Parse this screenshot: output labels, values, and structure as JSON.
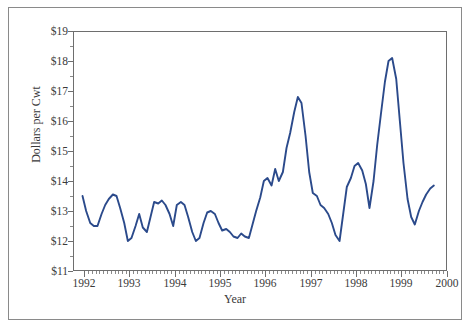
{
  "chart_data": {
    "type": "line",
    "title": "",
    "xlabel": "Year",
    "ylabel": "Dollars per Cwt",
    "xlim": [
      1991.75,
      2000.0
    ],
    "ylim": [
      11,
      19
    ],
    "grid": false,
    "legend": null,
    "line_color": "#2b4a8b",
    "y_tick_labels": [
      "$19",
      "$18",
      "$17",
      "$16",
      "$15",
      "$14",
      "$13",
      "$12",
      "$11"
    ],
    "y_tick_values": [
      19,
      18,
      17,
      16,
      15,
      14,
      13,
      12,
      11
    ],
    "y_minor_step": 0.5,
    "x_tick_labels": [
      "1992",
      "1993",
      "1994",
      "1995",
      "1996",
      "1997",
      "1998",
      "1999",
      "2000"
    ],
    "x_tick_values": [
      1992,
      1993,
      1994,
      1995,
      1996,
      1997,
      1998,
      1999,
      2000
    ],
    "x_minor_step": 0.0833,
    "series": [
      {
        "name": "Milk price",
        "x": [
          1991.96,
          1992.04,
          1992.13,
          1992.21,
          1992.29,
          1992.38,
          1992.46,
          1992.54,
          1992.63,
          1992.71,
          1992.79,
          1992.88,
          1992.96,
          1993.04,
          1993.13,
          1993.21,
          1993.29,
          1993.38,
          1993.46,
          1993.54,
          1993.63,
          1993.71,
          1993.79,
          1993.88,
          1993.96,
          1994.04,
          1994.13,
          1994.21,
          1994.29,
          1994.38,
          1994.46,
          1994.54,
          1994.63,
          1994.71,
          1994.79,
          1994.88,
          1994.96,
          1995.04,
          1995.13,
          1995.21,
          1995.29,
          1995.38,
          1995.46,
          1995.54,
          1995.63,
          1995.71,
          1995.79,
          1995.88,
          1995.96,
          1996.04,
          1996.13,
          1996.21,
          1996.29,
          1996.38,
          1996.46,
          1996.54,
          1996.63,
          1996.71,
          1996.79,
          1996.88,
          1996.96,
          1997.04,
          1997.13,
          1997.21,
          1997.29,
          1997.38,
          1997.46,
          1997.54,
          1997.63,
          1997.71,
          1997.79,
          1997.88,
          1997.96,
          1998.04,
          1998.13,
          1998.21,
          1998.29,
          1998.38,
          1998.46,
          1998.54,
          1998.63,
          1998.71,
          1998.79,
          1998.88,
          1998.96,
          1999.04,
          1999.13,
          1999.21,
          1999.29,
          1999.38,
          1999.46,
          1999.54,
          1999.63,
          1999.71
        ],
        "values": [
          13.5,
          13.0,
          12.6,
          12.5,
          12.5,
          12.9,
          13.2,
          13.4,
          13.55,
          13.5,
          13.1,
          12.6,
          12.0,
          12.1,
          12.5,
          12.9,
          12.45,
          12.3,
          12.8,
          13.3,
          13.25,
          13.35,
          13.2,
          12.9,
          12.5,
          13.2,
          13.3,
          13.2,
          12.8,
          12.3,
          12.0,
          12.1,
          12.6,
          12.95,
          13.0,
          12.9,
          12.6,
          12.35,
          12.4,
          12.3,
          12.15,
          12.1,
          12.25,
          12.15,
          12.1,
          12.55,
          13.0,
          13.45,
          14.0,
          14.1,
          13.85,
          14.4,
          14.0,
          14.3,
          15.1,
          15.6,
          16.3,
          16.8,
          16.6,
          15.5,
          14.3,
          13.6,
          13.5,
          13.2,
          13.1,
          12.9,
          12.6,
          12.2,
          12.0,
          12.9,
          13.8,
          14.1,
          14.5,
          14.6,
          14.35,
          13.9,
          13.1,
          14.0,
          15.2,
          16.2,
          17.3,
          18.0,
          18.1,
          17.4,
          16.0,
          14.6,
          13.4,
          12.8,
          12.55,
          13.0,
          13.3,
          13.55,
          13.75,
          13.85
        ]
      }
    ]
  }
}
